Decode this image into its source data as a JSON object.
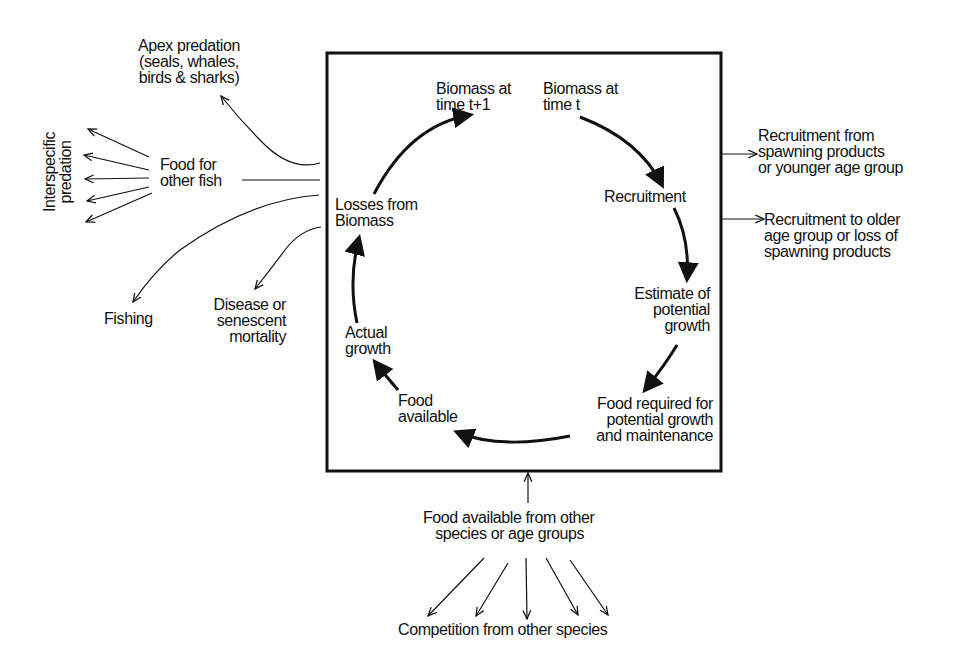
{
  "diagram": {
    "type": "flow-cycle",
    "box": {
      "cycle_nodes": [
        {
          "id": "biomass_t",
          "label": "Biomass at\ntime t"
        },
        {
          "id": "recruitment",
          "label": "Recruitment"
        },
        {
          "id": "estimate_growth",
          "label": "Estimate of\npotential\ngrowth"
        },
        {
          "id": "food_required",
          "label": "Food required for\npotential growth\nand maintenance"
        },
        {
          "id": "food_available",
          "label": "Food\navailable"
        },
        {
          "id": "actual_growth",
          "label": "Actual\ngrowth"
        },
        {
          "id": "losses",
          "label": "Losses from\nBiomass"
        },
        {
          "id": "biomass_t1",
          "label": "Biomass at\ntime t+1"
        }
      ]
    },
    "left_outputs": {
      "apex_predation": "Apex predation\n(seals, whales,\nbirds & sharks)",
      "food_for_other_fish": "Food for\nother fish",
      "interspecific_predation": "Interspecific\npredation",
      "fishing": "Fishing",
      "disease": "Disease or\nsenescent\nmortality"
    },
    "right_flows": {
      "recruitment_in": "Recruitment from\nspawning products\nor younger age group",
      "recruitment_out": "Recruitment to older\nage group or loss of\nspawning products"
    },
    "bottom_inputs": {
      "food_other_species": "Food available from other\n   species or age groups",
      "competition": "Competition from other species"
    },
    "edges": [
      [
        "biomass_t",
        "recruitment"
      ],
      [
        "recruitment",
        "estimate_growth"
      ],
      [
        "estimate_growth",
        "food_required"
      ],
      [
        "food_required",
        "food_available"
      ],
      [
        "food_available",
        "actual_growth"
      ],
      [
        "actual_growth",
        "losses"
      ],
      [
        "losses",
        "biomass_t1"
      ],
      [
        "box",
        "apex_predation"
      ],
      [
        "box",
        "food_for_other_fish"
      ],
      [
        "food_for_other_fish",
        "interspecific_predation"
      ],
      [
        "box",
        "fishing"
      ],
      [
        "box",
        "disease"
      ],
      [
        "recruitment_in",
        "box"
      ],
      [
        "box",
        "recruitment_out"
      ],
      [
        "food_other_species",
        "box"
      ],
      [
        "food_other_species",
        "competition"
      ]
    ],
    "colors": {
      "ink": "#111111",
      "background": "#ffffff"
    }
  }
}
